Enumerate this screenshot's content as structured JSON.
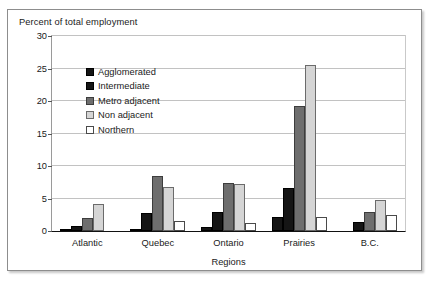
{
  "chart_data": {
    "type": "bar",
    "title": "Percent of total employment",
    "xlabel": "Regions",
    "ylabel": "Percent of total employment",
    "categories": [
      "Atlantic",
      "Quebec",
      "Ontario",
      "Prairies",
      "B.C."
    ],
    "series": [
      {
        "name": "Agglomerated",
        "values": [
          0.2,
          0.3,
          0.6,
          2.2,
          0.0
        ]
      },
      {
        "name": "Intermediate",
        "values": [
          0.7,
          2.8,
          2.9,
          6.6,
          1.4
        ]
      },
      {
        "name": "Metro adjacent",
        "values": [
          2.0,
          8.4,
          7.4,
          19.3,
          2.9
        ]
      },
      {
        "name": "Non adjacent",
        "values": [
          4.1,
          6.8,
          7.2,
          25.6,
          4.8
        ]
      },
      {
        "name": "Northern",
        "values": [
          0.0,
          1.6,
          1.2,
          2.2,
          2.4
        ]
      }
    ],
    "ylim": [
      0,
      30
    ],
    "yticks": [
      0,
      5,
      10,
      15,
      20,
      25,
      30
    ],
    "ytick_labels": [
      "0",
      "5",
      "10",
      "15",
      "20",
      "25",
      "30"
    ],
    "grid": true,
    "legend_position": "inside-upper-left",
    "colors": {
      "agglomerated": "#151515",
      "intermediate": "#151515",
      "metro_adjacent": "#6e6e6e",
      "non_adjacent": "#d5d5d5",
      "northern": "#ffffff",
      "gridline": "#c2c2c2",
      "axis": "#111111",
      "frame": "#8d8d8d"
    }
  }
}
